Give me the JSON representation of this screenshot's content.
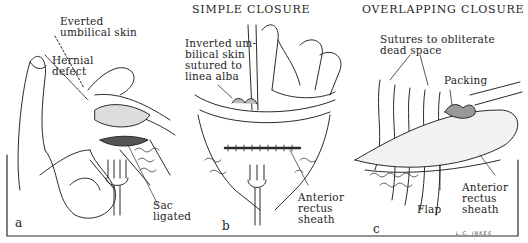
{
  "figure": {
    "panels": [
      {
        "letter": "a",
        "title": "",
        "labels": [
          "Everted\numbilical skin",
          "Hernial\ndefect",
          "Sac\nligated"
        ]
      },
      {
        "letter": "b",
        "title": "SIMPLE CLOSURE",
        "labels": [
          "Inverted um-\nbilical skin\nsutured to\nlinea alba",
          "Anterior\nrectus\nsheath"
        ]
      },
      {
        "letter": "c",
        "title": "OVERLAPPING CLOSURE",
        "labels": [
          "Sutures to obliterate\ndead space",
          "Packing",
          "Flap",
          "Anterior\nrectus\nsheath"
        ]
      }
    ],
    "signature": "L.C. INKES",
    "colors": {
      "ink": "#1e1e1e",
      "paper": "#ffffff"
    }
  }
}
